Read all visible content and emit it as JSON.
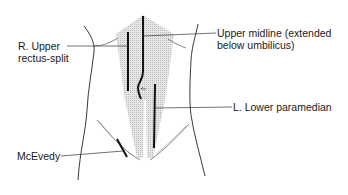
{
  "diagram": {
    "labels": {
      "r_upper_rectus_split_line1": "R. Upper",
      "r_upper_rectus_split_line2": "rectus-split",
      "upper_midline_line1": "Upper midline (extended",
      "upper_midline_line2": "below umbilicus)",
      "l_lower_paramedian": "L. Lower paramedian",
      "mcevedy": "McEvedy"
    },
    "colors": {
      "shade": "#d8d8d8",
      "incision": "#111111",
      "outline": "#222222",
      "leader": "#333333"
    }
  }
}
